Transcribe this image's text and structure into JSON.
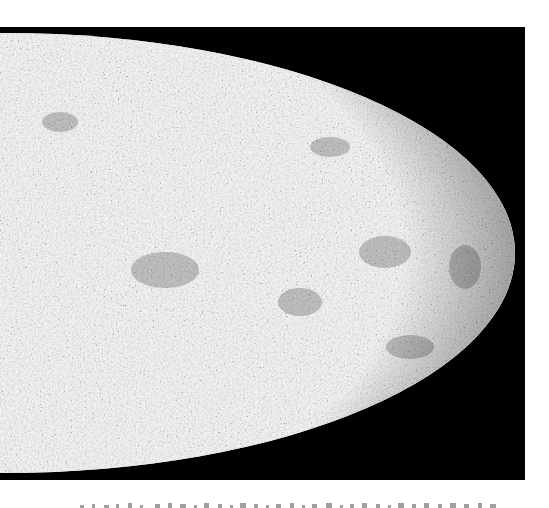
{
  "figure": {
    "type": "all-sky-map",
    "projection": "mollweide-right-half",
    "background_color": "#000000",
    "map_light_color": "#d9d9d9",
    "map_dark_color": "#4a4a4a",
    "page_background": "#ffffff"
  },
  "caption": {
    "visible": "partially cut off at bottom edge (illegible)",
    "color": "#9a9a9a"
  }
}
